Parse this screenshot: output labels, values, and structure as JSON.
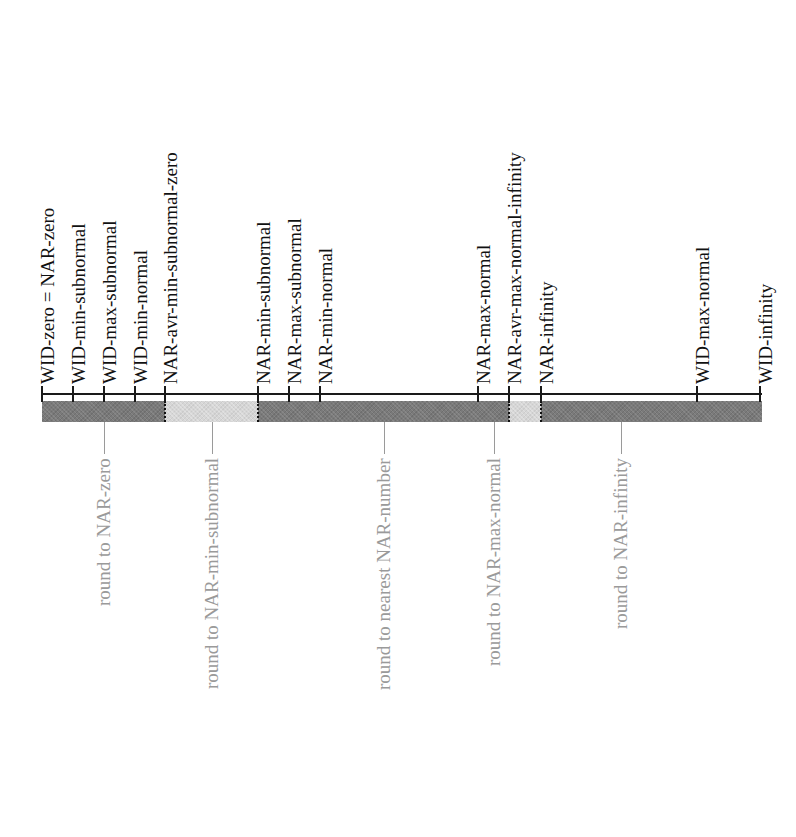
{
  "diagram": {
    "axis": {
      "x_start": 42,
      "x_end": 762,
      "y": 394
    },
    "bar": {
      "top": 401,
      "bottom": 422
    },
    "colors": {
      "dark_segment": "#7a7a7a",
      "light_segment": "#d6d6d6",
      "label_text": "#111111",
      "rounding_text": "#9a9a9a"
    },
    "ticks": [
      {
        "x": 42,
        "label": "WID-zero = NAR-zero"
      },
      {
        "x": 73,
        "label": "WID-min-subnormal"
      },
      {
        "x": 104,
        "label": "WID-max-subnormal"
      },
      {
        "x": 135,
        "label": "WID-min-normal"
      },
      {
        "x": 165,
        "label": "NAR-avr-min-subnormal-zero"
      },
      {
        "x": 258,
        "label": "NAR-min-subnormal"
      },
      {
        "x": 289,
        "label": "NAR-max-subnormal"
      },
      {
        "x": 320,
        "label": "NAR-min-normal"
      },
      {
        "x": 478,
        "label": "NAR-max-normal"
      },
      {
        "x": 509,
        "label": "NAR-avr-max-normal-infinity"
      },
      {
        "x": 541,
        "label": "NAR-infinity"
      },
      {
        "x": 697,
        "label": "WID-max-normal"
      },
      {
        "x": 760,
        "label": "WID-infinity"
      }
    ],
    "segments": [
      {
        "x0": 42,
        "x1": 165,
        "shade": "dark"
      },
      {
        "x0": 165,
        "x1": 258,
        "shade": "light"
      },
      {
        "x0": 258,
        "x1": 509,
        "shade": "dark"
      },
      {
        "x0": 509,
        "x1": 541,
        "shade": "light"
      },
      {
        "x0": 541,
        "x1": 762,
        "shade": "dark"
      }
    ],
    "rounding_regions": [
      {
        "connector_x": 104,
        "label": "round to NAR-zero"
      },
      {
        "connector_x": 212,
        "label": "round to NAR-min-subnormal"
      },
      {
        "connector_x": 384,
        "label": "round to nearest NAR-number"
      },
      {
        "connector_x": 494,
        "label": "round to NAR-max-normal"
      },
      {
        "connector_x": 621,
        "label": "round to NAR-infinity"
      }
    ]
  }
}
